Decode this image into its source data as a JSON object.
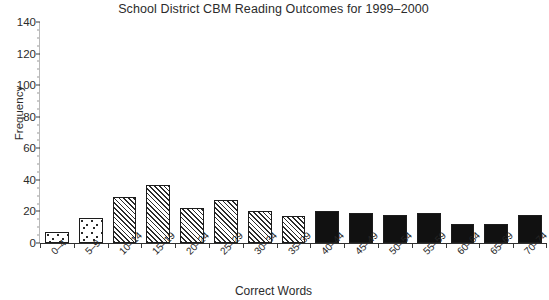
{
  "chart_data": {
    "type": "bar",
    "title": "School District CBM Reading Outcomes for 1999–2000",
    "xlabel": "Correct Words",
    "ylabel": "Frequency",
    "categories": [
      "0–4",
      "5–9",
      "10–14",
      "15–19",
      "20–24",
      "25–29",
      "30–34",
      "35–39",
      "40–44",
      "45–49",
      "50–54",
      "55–59",
      "60–64",
      "65–69",
      "70–74"
    ],
    "values": [
      7,
      16,
      29,
      37,
      22,
      27,
      20,
      17,
      20,
      19,
      18,
      19,
      12,
      12,
      18
    ],
    "fills": [
      "speckle",
      "speckle",
      "hatch",
      "hatch",
      "hatch",
      "hatch",
      "hatch",
      "hatch",
      "solid",
      "solid",
      "solid",
      "solid",
      "solid",
      "solid",
      "solid"
    ],
    "ylim": [
      0,
      140
    ],
    "yticks": [
      0,
      20,
      40,
      60,
      80,
      100,
      120,
      140
    ],
    "ytick_labels": [
      "0",
      "20",
      "40",
      "60",
      "80",
      "100",
      "120",
      "140"
    ],
    "y_minor_step": 5,
    "grid": false,
    "legend": "none",
    "colors": {
      "axis": "#2f2f2f",
      "bar_edge": "#1c1c1c",
      "bar_solid": "#111111",
      "text": "#2b2b2b",
      "background": "#ffffff"
    }
  }
}
